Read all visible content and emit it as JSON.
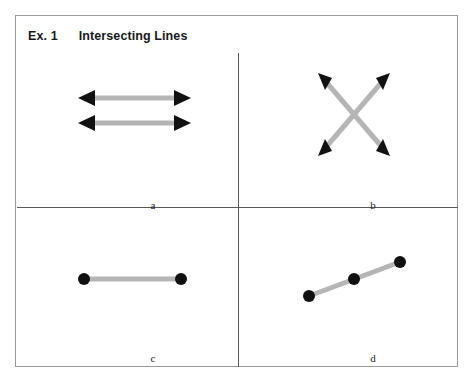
{
  "figure": {
    "title_prefix": "Ex. 1",
    "title_text": "Intersecting Lines",
    "background_color": "#ffffff",
    "frame_color": "#9a9a9a",
    "divider_color": "#595959",
    "line_color": "#b5b5b5",
    "marker_color": "#111111"
  },
  "panels": [
    {
      "id": "a",
      "label": "a",
      "description": "two parallel horizontal double-headed arrows",
      "figure_type": "double-headed-arrows",
      "count": 2
    },
    {
      "id": "b",
      "label": "b",
      "description": "two double-headed arrows crossing in an X",
      "figure_type": "double-headed-arrows",
      "count": 2
    },
    {
      "id": "c",
      "label": "c",
      "description": "horizontal segment with two endpoint dots",
      "figure_type": "segment-with-points",
      "count": 2
    },
    {
      "id": "d",
      "label": "d",
      "description": "diagonal rising segment with three dots",
      "figure_type": "segment-with-points",
      "count": 3
    }
  ]
}
